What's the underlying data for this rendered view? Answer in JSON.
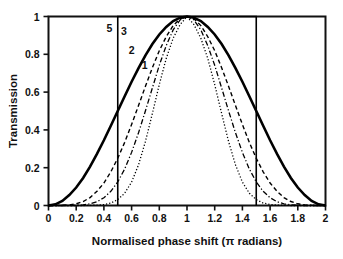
{
  "chart_data": {
    "type": "line",
    "title": "",
    "xlabel": "Normalised phase shift (π radians)",
    "ylabel": "Transmission",
    "xlim": [
      0,
      2
    ],
    "ylim": [
      0,
      1
    ],
    "grid": false,
    "legend_position": "inline-annotations",
    "xticks": [
      0,
      0.2,
      0.4,
      0.6,
      0.8,
      1,
      1.2,
      1.4,
      1.6,
      1.8,
      2
    ],
    "xtick_labels": [
      "0",
      "0.2",
      "0.4",
      "0.6",
      "0.8",
      "1",
      "1.2",
      "1.4",
      "1.6",
      "1.8",
      "2"
    ],
    "yticks": [
      0,
      0.2,
      0.4,
      0.6,
      0.8,
      1
    ],
    "ytick_labels": [
      "0",
      "0.2",
      "0.4",
      "0.6",
      "0.8",
      "1"
    ],
    "annotations": [
      {
        "text": "5",
        "x": 0.44,
        "y": 0.92
      },
      {
        "text": "3",
        "x": 0.545,
        "y": 0.9
      },
      {
        "text": "2",
        "x": 0.6,
        "y": 0.8
      },
      {
        "text": "1",
        "x": 0.695,
        "y": 0.72
      }
    ],
    "series": [
      {
        "name": "1",
        "style": "solid",
        "width": 2.6,
        "color": "#000000",
        "x": [
          0,
          0.05,
          0.1,
          0.15,
          0.2,
          0.25,
          0.3,
          0.35,
          0.4,
          0.45,
          0.5,
          0.55,
          0.6,
          0.65,
          0.7,
          0.75,
          0.8,
          0.85,
          0.9,
          0.95,
          1,
          1.05,
          1.1,
          1.15,
          1.2,
          1.25,
          1.3,
          1.35,
          1.4,
          1.45,
          1.5,
          1.55,
          1.6,
          1.65,
          1.7,
          1.75,
          1.8,
          1.85,
          1.9,
          1.95,
          2
        ],
        "values": [
          0,
          0.006,
          0.024,
          0.055,
          0.095,
          0.146,
          0.206,
          0.273,
          0.345,
          0.422,
          0.5,
          0.578,
          0.655,
          0.727,
          0.794,
          0.854,
          0.905,
          0.945,
          0.976,
          0.994,
          1,
          0.994,
          0.976,
          0.945,
          0.905,
          0.854,
          0.794,
          0.727,
          0.655,
          0.578,
          0.5,
          0.422,
          0.345,
          0.273,
          0.206,
          0.146,
          0.095,
          0.055,
          0.024,
          0.006,
          0
        ]
      },
      {
        "name": "2",
        "style": "dashed",
        "width": 1.4,
        "color": "#000000",
        "x": [
          0,
          0.05,
          0.1,
          0.15,
          0.2,
          0.25,
          0.3,
          0.35,
          0.4,
          0.45,
          0.5,
          0.55,
          0.6,
          0.65,
          0.7,
          0.75,
          0.8,
          0.85,
          0.9,
          0.95,
          1,
          1.05,
          1.1,
          1.15,
          1.2,
          1.25,
          1.3,
          1.35,
          1.4,
          1.45,
          1.5,
          1.55,
          1.6,
          1.65,
          1.7,
          1.75,
          1.8,
          1.85,
          1.9,
          1.95,
          2
        ],
        "values": [
          0,
          0.0,
          0.001,
          0.003,
          0.009,
          0.021,
          0.042,
          0.075,
          0.119,
          0.178,
          0.25,
          0.334,
          0.429,
          0.529,
          0.631,
          0.729,
          0.819,
          0.893,
          0.952,
          0.988,
          1,
          0.988,
          0.952,
          0.893,
          0.819,
          0.729,
          0.631,
          0.529,
          0.429,
          0.334,
          0.25,
          0.178,
          0.119,
          0.075,
          0.042,
          0.021,
          0.009,
          0.003,
          0.001,
          0.0,
          0
        ]
      },
      {
        "name": "3",
        "style": "dashdot",
        "width": 1.3,
        "color": "#000000",
        "x": [
          0,
          0.05,
          0.1,
          0.15,
          0.2,
          0.25,
          0.3,
          0.35,
          0.4,
          0.45,
          0.5,
          0.55,
          0.6,
          0.65,
          0.7,
          0.75,
          0.8,
          0.85,
          0.9,
          0.95,
          1,
          1.05,
          1.1,
          1.15,
          1.2,
          1.25,
          1.3,
          1.35,
          1.4,
          1.45,
          1.5,
          1.55,
          1.6,
          1.65,
          1.7,
          1.75,
          1.8,
          1.85,
          1.9,
          1.95,
          2
        ],
        "values": [
          0,
          0.0,
          0.0,
          0.0,
          0.001,
          0.003,
          0.009,
          0.02,
          0.041,
          0.075,
          0.125,
          0.193,
          0.281,
          0.385,
          0.501,
          0.622,
          0.742,
          0.846,
          0.929,
          0.982,
          1,
          0.982,
          0.929,
          0.846,
          0.742,
          0.622,
          0.501,
          0.385,
          0.281,
          0.193,
          0.125,
          0.075,
          0.041,
          0.02,
          0.009,
          0.003,
          0.001,
          0.0,
          0.0,
          0.0,
          0
        ]
      },
      {
        "name": "5",
        "style": "dotted",
        "width": 1.3,
        "color": "#000000",
        "x": [
          0,
          0.1,
          0.2,
          0.25,
          0.3,
          0.35,
          0.4,
          0.45,
          0.5,
          0.55,
          0.6,
          0.65,
          0.7,
          0.75,
          0.8,
          0.85,
          0.9,
          0.95,
          1,
          1.05,
          1.1,
          1.15,
          1.2,
          1.25,
          1.3,
          1.35,
          1.4,
          1.45,
          1.5,
          1.55,
          1.6,
          1.65,
          1.7,
          1.75,
          1.8,
          1.9,
          2
        ],
        "values": [
          0,
          0.0,
          0.0,
          0.0,
          0.001,
          0.002,
          0.005,
          0.013,
          0.031,
          0.065,
          0.124,
          0.215,
          0.339,
          0.487,
          0.64,
          0.778,
          0.885,
          0.957,
          1,
          0.957,
          0.885,
          0.778,
          0.64,
          0.487,
          0.339,
          0.215,
          0.124,
          0.065,
          0.031,
          0.013,
          0.005,
          0.002,
          0.001,
          0.0,
          0.0,
          0.0,
          0
        ]
      },
      {
        "name": "ideal-rectangle",
        "style": "solid",
        "width": 1.6,
        "color": "#000000",
        "x": [
          0.5,
          0.5,
          1.5,
          1.5
        ],
        "values": [
          0,
          1,
          1,
          0
        ]
      }
    ]
  }
}
